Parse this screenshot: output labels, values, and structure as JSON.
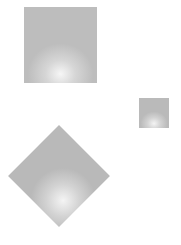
{
  "canvas": {
    "width": 181,
    "height": 245,
    "background": "#ffffff"
  },
  "shapes": [
    {
      "id": "large-square",
      "type": "square",
      "x": 24,
      "y": 7,
      "width": 73,
      "height": 76,
      "fill": "gray radial gradient",
      "base_color": "#bdbdbd",
      "highlight_color": "#f6f6f6"
    },
    {
      "id": "small-square",
      "type": "square",
      "x": 139,
      "y": 98,
      "width": 30,
      "height": 30,
      "fill": "gray radial gradient",
      "base_color": "#bababa",
      "highlight_color": "#f4f4f4"
    },
    {
      "id": "diamond",
      "type": "square-rotated-45",
      "center_x": 59,
      "center_y": 176,
      "side": 72,
      "fill": "gray radial gradient",
      "base_color": "#b9b9b9",
      "highlight_color": "#f4f4f4"
    }
  ]
}
